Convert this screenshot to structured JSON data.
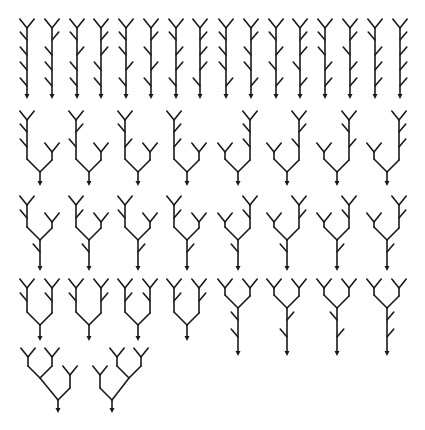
{
  "colors": {
    "ink": "#1a1a1a",
    "background": "#ffffff"
  },
  "style": {
    "twig": 8,
    "fork": 9,
    "arrow": 4
  },
  "rows": [
    {
      "name": "row-1-single-stems",
      "trees": [
        {
          "type": "stem",
          "x": 27,
          "top": 28,
          "bottom": 98,
          "twigs": [
            [
              "L",
              40
            ],
            [
              "L",
              55
            ],
            [
              "L",
              70
            ],
            [
              "L",
              86
            ]
          ]
        },
        {
          "type": "stem",
          "x": 52,
          "top": 28,
          "bottom": 98,
          "twigs": [
            [
              "R",
              40
            ],
            [
              "L",
              55
            ],
            [
              "L",
              70
            ],
            [
              "L",
              86
            ]
          ]
        },
        {
          "type": "stem",
          "x": 77,
          "top": 28,
          "bottom": 98,
          "twigs": [
            [
              "L",
              40
            ],
            [
              "R",
              55
            ],
            [
              "L",
              70
            ],
            [
              "L",
              86
            ]
          ]
        },
        {
          "type": "stem",
          "x": 101,
          "top": 28,
          "bottom": 98,
          "twigs": [
            [
              "R",
              40
            ],
            [
              "R",
              55
            ],
            [
              "L",
              70
            ],
            [
              "L",
              86
            ]
          ]
        },
        {
          "type": "stem",
          "x": 126,
          "top": 28,
          "bottom": 98,
          "twigs": [
            [
              "L",
              40
            ],
            [
              "L",
              55
            ],
            [
              "R",
              70
            ],
            [
              "L",
              86
            ]
          ]
        },
        {
          "type": "stem",
          "x": 151,
          "top": 28,
          "bottom": 98,
          "twigs": [
            [
              "R",
              40
            ],
            [
              "L",
              55
            ],
            [
              "R",
              70
            ],
            [
              "L",
              86
            ]
          ]
        },
        {
          "type": "stem",
          "x": 176,
          "top": 28,
          "bottom": 98,
          "twigs": [
            [
              "L",
              40
            ],
            [
              "R",
              55
            ],
            [
              "R",
              70
            ],
            [
              "L",
              86
            ]
          ]
        },
        {
          "type": "stem",
          "x": 200,
          "top": 28,
          "bottom": 98,
          "twigs": [
            [
              "R",
              40
            ],
            [
              "R",
              55
            ],
            [
              "R",
              70
            ],
            [
              "L",
              86
            ]
          ]
        },
        {
          "type": "stem",
          "x": 226,
          "top": 28,
          "bottom": 98,
          "twigs": [
            [
              "L",
              40
            ],
            [
              "L",
              55
            ],
            [
              "L",
              70
            ],
            [
              "R",
              86
            ]
          ]
        },
        {
          "type": "stem",
          "x": 251,
          "top": 28,
          "bottom": 98,
          "twigs": [
            [
              "R",
              40
            ],
            [
              "L",
              55
            ],
            [
              "L",
              70
            ],
            [
              "R",
              86
            ]
          ]
        },
        {
          "type": "stem",
          "x": 276,
          "top": 28,
          "bottom": 98,
          "twigs": [
            [
              "L",
              40
            ],
            [
              "R",
              55
            ],
            [
              "L",
              70
            ],
            [
              "R",
              86
            ]
          ]
        },
        {
          "type": "stem",
          "x": 300,
          "top": 28,
          "bottom": 98,
          "twigs": [
            [
              "R",
              40
            ],
            [
              "R",
              55
            ],
            [
              "L",
              70
            ],
            [
              "R",
              86
            ]
          ]
        },
        {
          "type": "stem",
          "x": 325,
          "top": 28,
          "bottom": 98,
          "twigs": [
            [
              "L",
              40
            ],
            [
              "L",
              55
            ],
            [
              "R",
              70
            ],
            [
              "R",
              86
            ]
          ]
        },
        {
          "type": "stem",
          "x": 350,
          "top": 28,
          "bottom": 98,
          "twigs": [
            [
              "R",
              40
            ],
            [
              "L",
              55
            ],
            [
              "R",
              70
            ],
            [
              "R",
              86
            ]
          ]
        },
        {
          "type": "stem",
          "x": 375,
          "top": 28,
          "bottom": 98,
          "twigs": [
            [
              "L",
              40
            ],
            [
              "R",
              55
            ],
            [
              "R",
              70
            ],
            [
              "R",
              86
            ]
          ]
        },
        {
          "type": "stem",
          "x": 400,
          "top": 28,
          "bottom": 98,
          "twigs": [
            [
              "R",
              40
            ],
            [
              "R",
              55
            ],
            [
              "R",
              70
            ],
            [
              "R",
              86
            ]
          ]
        }
      ]
    },
    {
      "name": "row-2-tall-short",
      "trees": [
        {
          "type": "split",
          "root": 40,
          "join": 172,
          "bottom": 185,
          "left": {
            "x": 27,
            "top": 120,
            "twigs": [
              [
                "L",
                132
              ],
              [
                "L",
                147
              ]
            ]
          },
          "right": {
            "x": 52,
            "top": 152,
            "twigs": []
          }
        },
        {
          "type": "split",
          "root": 89,
          "join": 172,
          "bottom": 185,
          "left": {
            "x": 76,
            "top": 120,
            "twigs": [
              [
                "R",
                132
              ],
              [
                "L",
                147
              ]
            ]
          },
          "right": {
            "x": 101,
            "top": 152,
            "twigs": []
          }
        },
        {
          "type": "split",
          "root": 138,
          "join": 172,
          "bottom": 185,
          "left": {
            "x": 125,
            "top": 120,
            "twigs": [
              [
                "L",
                132
              ],
              [
                "R",
                147
              ]
            ]
          },
          "right": {
            "x": 150,
            "top": 152,
            "twigs": []
          }
        },
        {
          "type": "split",
          "root": 187,
          "join": 172,
          "bottom": 185,
          "left": {
            "x": 174,
            "top": 120,
            "twigs": [
              [
                "R",
                132
              ],
              [
                "R",
                147
              ]
            ]
          },
          "right": {
            "x": 199,
            "top": 152,
            "twigs": []
          }
        },
        {
          "type": "split",
          "root": 238,
          "join": 172,
          "bottom": 185,
          "left": {
            "x": 225,
            "top": 152,
            "twigs": []
          },
          "right": {
            "x": 250,
            "top": 120,
            "twigs": [
              [
                "L",
                132
              ],
              [
                "L",
                147
              ]
            ]
          }
        },
        {
          "type": "split",
          "root": 287,
          "join": 172,
          "bottom": 185,
          "left": {
            "x": 274,
            "top": 152,
            "twigs": []
          },
          "right": {
            "x": 299,
            "top": 120,
            "twigs": [
              [
                "R",
                132
              ],
              [
                "L",
                147
              ]
            ]
          }
        },
        {
          "type": "split",
          "root": 337,
          "join": 172,
          "bottom": 185,
          "left": {
            "x": 324,
            "top": 152,
            "twigs": []
          },
          "right": {
            "x": 349,
            "top": 120,
            "twigs": [
              [
                "L",
                132
              ],
              [
                "R",
                147
              ]
            ]
          }
        },
        {
          "type": "split",
          "root": 387,
          "join": 172,
          "bottom": 185,
          "left": {
            "x": 374,
            "top": 152,
            "twigs": []
          },
          "right": {
            "x": 399,
            "top": 120,
            "twigs": [
              [
                "R",
                132
              ],
              [
                "R",
                147
              ]
            ]
          }
        }
      ]
    },
    {
      "name": "row-3-medium",
      "trees": [
        {
          "type": "split",
          "root": 40,
          "join": 240,
          "bottom": 270,
          "trunkTwigs": [
            [
              "L",
              252
            ]
          ],
          "left": {
            "x": 27,
            "top": 205,
            "twigs": [
              [
                "L",
                218
              ]
            ]
          },
          "right": {
            "x": 52,
            "top": 222,
            "twigs": []
          }
        },
        {
          "type": "split",
          "root": 89,
          "join": 240,
          "bottom": 270,
          "trunkTwigs": [
            [
              "L",
              252
            ]
          ],
          "left": {
            "x": 76,
            "top": 205,
            "twigs": [
              [
                "R",
                218
              ]
            ]
          },
          "right": {
            "x": 101,
            "top": 222,
            "twigs": []
          }
        },
        {
          "type": "split",
          "root": 138,
          "join": 240,
          "bottom": 270,
          "trunkTwigs": [
            [
              "R",
              252
            ]
          ],
          "left": {
            "x": 125,
            "top": 205,
            "twigs": [
              [
                "L",
                218
              ]
            ]
          },
          "right": {
            "x": 150,
            "top": 222,
            "twigs": []
          }
        },
        {
          "type": "split",
          "root": 187,
          "join": 240,
          "bottom": 270,
          "trunkTwigs": [
            [
              "R",
              252
            ]
          ],
          "left": {
            "x": 174,
            "top": 205,
            "twigs": [
              [
                "R",
                218
              ]
            ]
          },
          "right": {
            "x": 199,
            "top": 222,
            "twigs": []
          }
        },
        {
          "type": "split",
          "root": 238,
          "join": 240,
          "bottom": 270,
          "trunkTwigs": [
            [
              "L",
              252
            ]
          ],
          "left": {
            "x": 225,
            "top": 222,
            "twigs": []
          },
          "right": {
            "x": 250,
            "top": 205,
            "twigs": [
              [
                "L",
                218
              ]
            ]
          }
        },
        {
          "type": "split",
          "root": 287,
          "join": 240,
          "bottom": 270,
          "trunkTwigs": [
            [
              "L",
              252
            ]
          ],
          "left": {
            "x": 274,
            "top": 222,
            "twigs": []
          },
          "right": {
            "x": 299,
            "top": 205,
            "twigs": [
              [
                "R",
                218
              ]
            ]
          }
        },
        {
          "type": "split",
          "root": 337,
          "join": 240,
          "bottom": 270,
          "trunkTwigs": [
            [
              "R",
              252
            ]
          ],
          "left": {
            "x": 324,
            "top": 222,
            "twigs": []
          },
          "right": {
            "x": 349,
            "top": 205,
            "twigs": [
              [
                "L",
                218
              ]
            ]
          }
        },
        {
          "type": "split",
          "root": 387,
          "join": 240,
          "bottom": 270,
          "trunkTwigs": [
            [
              "R",
              252
            ]
          ],
          "left": {
            "x": 374,
            "top": 222,
            "twigs": []
          },
          "right": {
            "x": 399,
            "top": 205,
            "twigs": [
              [
                "R",
                218
              ]
            ]
          }
        }
      ]
    },
    {
      "name": "row-4-balanced-and-long-trunk",
      "trees": [
        {
          "type": "split",
          "root": 40,
          "join": 325,
          "bottom": 340,
          "left": {
            "x": 27,
            "top": 288,
            "twigs": [
              [
                "L",
                301
              ]
            ]
          },
          "right": {
            "x": 52,
            "top": 288,
            "twigs": [
              [
                "L",
                301
              ]
            ]
          }
        },
        {
          "type": "split",
          "root": 89,
          "join": 325,
          "bottom": 340,
          "left": {
            "x": 76,
            "top": 288,
            "twigs": [
              [
                "L",
                301
              ]
            ]
          },
          "right": {
            "x": 101,
            "top": 288,
            "twigs": [
              [
                "R",
                301
              ]
            ]
          }
        },
        {
          "type": "split",
          "root": 138,
          "join": 325,
          "bottom": 340,
          "left": {
            "x": 125,
            "top": 288,
            "twigs": [
              [
                "R",
                301
              ]
            ]
          },
          "right": {
            "x": 150,
            "top": 288,
            "twigs": [
              [
                "L",
                301
              ]
            ]
          }
        },
        {
          "type": "split",
          "root": 187,
          "join": 325,
          "bottom": 340,
          "left": {
            "x": 174,
            "top": 288,
            "twigs": [
              [
                "R",
                301
              ]
            ]
          },
          "right": {
            "x": 199,
            "top": 288,
            "twigs": [
              [
                "R",
                301
              ]
            ]
          }
        },
        {
          "type": "split",
          "root": 238,
          "join": 308,
          "bottom": 355,
          "trunkTwigs": [
            [
              "L",
              320
            ],
            [
              "L",
              337
            ]
          ],
          "left": {
            "x": 225,
            "top": 288,
            "twigs": []
          },
          "right": {
            "x": 250,
            "top": 288,
            "twigs": []
          }
        },
        {
          "type": "split",
          "root": 287,
          "join": 308,
          "bottom": 355,
          "trunkTwigs": [
            [
              "R",
              320
            ],
            [
              "L",
              337
            ]
          ],
          "left": {
            "x": 274,
            "top": 288,
            "twigs": []
          },
          "right": {
            "x": 299,
            "top": 288,
            "twigs": []
          }
        },
        {
          "type": "split",
          "root": 337,
          "join": 308,
          "bottom": 355,
          "trunkTwigs": [
            [
              "L",
              320
            ],
            [
              "R",
              337
            ]
          ],
          "left": {
            "x": 324,
            "top": 288,
            "twigs": []
          },
          "right": {
            "x": 349,
            "top": 288,
            "twigs": []
          }
        },
        {
          "type": "split",
          "root": 387,
          "join": 308,
          "bottom": 355,
          "trunkTwigs": [
            [
              "R",
              320
            ],
            [
              "R",
              337
            ]
          ],
          "left": {
            "x": 374,
            "top": 288,
            "twigs": []
          },
          "right": {
            "x": 399,
            "top": 288,
            "twigs": []
          }
        }
      ]
    },
    {
      "name": "row-5-nested",
      "trees": [
        {
          "type": "nested",
          "root": 58,
          "join": 400,
          "bottom": 412,
          "inner": {
            "side": "L",
            "x": 40,
            "join": 378,
            "lx": 28,
            "rx": 52,
            "top": 357
          },
          "outer": {
            "x": 70,
            "top": 375
          }
        },
        {
          "type": "nested",
          "root": 112,
          "join": 400,
          "bottom": 412,
          "inner": {
            "side": "R",
            "x": 129,
            "join": 378,
            "lx": 117,
            "rx": 141,
            "top": 357
          },
          "outer": {
            "x": 100,
            "top": 375
          }
        }
      ]
    }
  ]
}
